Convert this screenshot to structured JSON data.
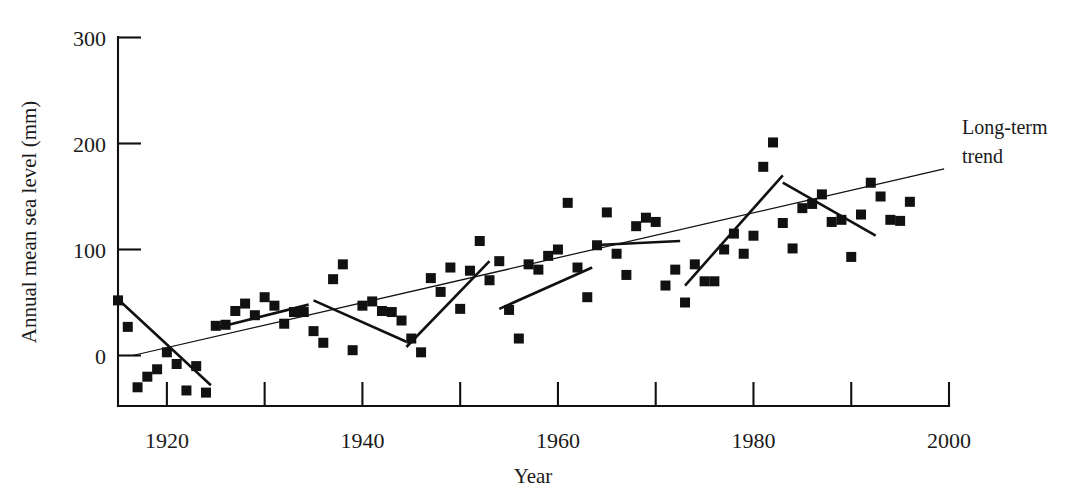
{
  "chart_data": {
    "type": "scatter",
    "title": "",
    "xlabel": "Year",
    "ylabel": "Annual mean sea level (mm)",
    "xlim": [
      1915,
      2000
    ],
    "ylim": [
      -60,
      300
    ],
    "grid": false,
    "legend_position": "none",
    "y_ticks": [
      0,
      100,
      200,
      300
    ],
    "y_tick_labels": [
      "0",
      "100",
      "200",
      "300"
    ],
    "x_ticks": [
      1920,
      1930,
      1940,
      1950,
      1960,
      1970,
      1980,
      1990,
      2000
    ],
    "x_tick_labels": [
      "1920",
      "",
      "1940",
      "",
      "1960",
      "",
      "1980",
      "",
      "2000"
    ],
    "x_major_labeled": [
      1920,
      1940,
      1960,
      1980,
      2000
    ],
    "marker": "filled-square",
    "marker_color": "#111111",
    "points": [
      {
        "x": 1915,
        "y": 52
      },
      {
        "x": 1916,
        "y": 27
      },
      {
        "x": 1917,
        "y": -30
      },
      {
        "x": 1918,
        "y": -20
      },
      {
        "x": 1919,
        "y": -13
      },
      {
        "x": 1920,
        "y": 3
      },
      {
        "x": 1921,
        "y": -8
      },
      {
        "x": 1922,
        "y": -33
      },
      {
        "x": 1923,
        "y": -10
      },
      {
        "x": 1924,
        "y": -35
      },
      {
        "x": 1925,
        "y": 28
      },
      {
        "x": 1926,
        "y": 29
      },
      {
        "x": 1927,
        "y": 42
      },
      {
        "x": 1928,
        "y": 49
      },
      {
        "x": 1929,
        "y": 38
      },
      {
        "x": 1930,
        "y": 55
      },
      {
        "x": 1931,
        "y": 47
      },
      {
        "x": 1932,
        "y": 30
      },
      {
        "x": 1933,
        "y": 41
      },
      {
        "x": 1934,
        "y": 41
      },
      {
        "x": 1935,
        "y": 23
      },
      {
        "x": 1936,
        "y": 12
      },
      {
        "x": 1937,
        "y": 72
      },
      {
        "x": 1938,
        "y": 86
      },
      {
        "x": 1939,
        "y": 5
      },
      {
        "x": 1940,
        "y": 47
      },
      {
        "x": 1941,
        "y": 51
      },
      {
        "x": 1942,
        "y": 42
      },
      {
        "x": 1943,
        "y": 41
      },
      {
        "x": 1944,
        "y": 33
      },
      {
        "x": 1945,
        "y": 16
      },
      {
        "x": 1946,
        "y": 3
      },
      {
        "x": 1947,
        "y": 73
      },
      {
        "x": 1948,
        "y": 60
      },
      {
        "x": 1949,
        "y": 83
      },
      {
        "x": 1950,
        "y": 44
      },
      {
        "x": 1951,
        "y": 80
      },
      {
        "x": 1952,
        "y": 108
      },
      {
        "x": 1953,
        "y": 71
      },
      {
        "x": 1954,
        "y": 89
      },
      {
        "x": 1955,
        "y": 43
      },
      {
        "x": 1956,
        "y": 16
      },
      {
        "x": 1957,
        "y": 86
      },
      {
        "x": 1958,
        "y": 81
      },
      {
        "x": 1959,
        "y": 94
      },
      {
        "x": 1960,
        "y": 100
      },
      {
        "x": 1961,
        "y": 144
      },
      {
        "x": 1962,
        "y": 83
      },
      {
        "x": 1963,
        "y": 55
      },
      {
        "x": 1964,
        "y": 104
      },
      {
        "x": 1965,
        "y": 135
      },
      {
        "x": 1966,
        "y": 96
      },
      {
        "x": 1967,
        "y": 76
      },
      {
        "x": 1968,
        "y": 122
      },
      {
        "x": 1969,
        "y": 130
      },
      {
        "x": 1970,
        "y": 126
      },
      {
        "x": 1971,
        "y": 66
      },
      {
        "x": 1972,
        "y": 81
      },
      {
        "x": 1973,
        "y": 50
      },
      {
        "x": 1974,
        "y": 86
      },
      {
        "x": 1975,
        "y": 70
      },
      {
        "x": 1976,
        "y": 70
      },
      {
        "x": 1977,
        "y": 100
      },
      {
        "x": 1978,
        "y": 115
      },
      {
        "x": 1979,
        "y": 96
      },
      {
        "x": 1980,
        "y": 113
      },
      {
        "x": 1981,
        "y": 178
      },
      {
        "x": 1982,
        "y": 201
      },
      {
        "x": 1983,
        "y": 125
      },
      {
        "x": 1984,
        "y": 101
      },
      {
        "x": 1985,
        "y": 139
      },
      {
        "x": 1986,
        "y": 143
      },
      {
        "x": 1987,
        "y": 152
      },
      {
        "x": 1988,
        "y": 126
      },
      {
        "x": 1989,
        "y": 128
      },
      {
        "x": 1990,
        "y": 93
      },
      {
        "x": 1991,
        "y": 133
      },
      {
        "x": 1992,
        "y": 163
      },
      {
        "x": 1993,
        "y": 150
      },
      {
        "x": 1994,
        "y": 128
      },
      {
        "x": 1995,
        "y": 127
      },
      {
        "x": 1996,
        "y": 145
      }
    ],
    "trend_lines": [
      {
        "name": "long-term-trend",
        "label": "Long-term trend",
        "style": "thin",
        "x0": 1916.5,
        "y0": 0,
        "x1": 1999.5,
        "y1": 176
      },
      {
        "name": "segment-1916-1924",
        "style": "thick",
        "x0": 1915.0,
        "y0": 53,
        "x1": 1924.5,
        "y1": -28
      },
      {
        "name": "segment-1925-1934",
        "style": "thick",
        "x0": 1925.0,
        "y0": 26,
        "x1": 1934.5,
        "y1": 48
      },
      {
        "name": "segment-1935-1944",
        "style": "thick",
        "x0": 1935.0,
        "y0": 52,
        "x1": 1944.5,
        "y1": 13
      },
      {
        "name": "segment-1944-1953",
        "style": "thick",
        "x0": 1944.5,
        "y0": 8,
        "x1": 1953.0,
        "y1": 89
      },
      {
        "name": "segment-1954-1963",
        "style": "thick",
        "x0": 1954.0,
        "y0": 44,
        "x1": 1963.5,
        "y1": 83
      },
      {
        "name": "segment-1963-1972",
        "style": "thick",
        "x0": 1963.5,
        "y0": 104,
        "x1": 1972.5,
        "y1": 108
      },
      {
        "name": "segment-1973-1983",
        "style": "thick",
        "x0": 1973.0,
        "y0": 66,
        "x1": 1983.0,
        "y1": 170
      },
      {
        "name": "segment-1983-1992",
        "style": "thick",
        "x0": 1983.0,
        "y0": 163,
        "x1": 1992.5,
        "y1": 113
      }
    ],
    "annotations": [
      {
        "name": "long-term-trend-label",
        "line1": "Long-term",
        "line2": "trend",
        "x": 1999,
        "y": 215
      }
    ]
  }
}
